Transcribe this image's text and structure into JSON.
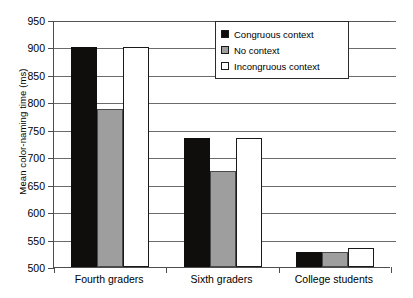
{
  "chart_data": {
    "type": "bar",
    "title": "",
    "xlabel": "",
    "ylabel": "Mean color-naming time (ms)",
    "ylim": [
      500,
      950
    ],
    "ytick_step": 50,
    "yticks": [
      950,
      900,
      850,
      800,
      750,
      700,
      650,
      600,
      550,
      500
    ],
    "grid": true,
    "legend_position": "top-right",
    "categories": [
      "Fourth graders",
      "Sixth graders",
      "College students"
    ],
    "series": [
      {
        "name": "Congruous context",
        "color": "#100d0d",
        "values": [
          900,
          735,
          528
        ]
      },
      {
        "name": "No context",
        "color": "#9e9e9e",
        "values": [
          788,
          675,
          528
        ]
      },
      {
        "name": "Incongruous context",
        "color": "#ffffff",
        "values": [
          900,
          735,
          535
        ]
      }
    ]
  },
  "legend": {
    "items": [
      {
        "label": "Congruous context",
        "swatch": "black-square-icon"
      },
      {
        "label": "No context",
        "swatch": "gray-square-icon"
      },
      {
        "label": "Incongruous context",
        "swatch": "white-square-icon"
      }
    ]
  },
  "axes": {
    "y_title": "Mean color-naming time (ms)",
    "y_labels": [
      "950",
      "900",
      "850",
      "800",
      "750",
      "700",
      "650",
      "600",
      "550",
      "500"
    ],
    "x_labels": [
      "Fourth graders",
      "Sixth graders",
      "College students"
    ]
  }
}
